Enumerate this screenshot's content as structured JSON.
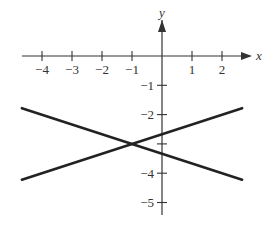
{
  "chart_data": {
    "type": "line",
    "title": "",
    "xlabel": "x",
    "ylabel": "y",
    "xlim": [
      -4.67,
      2.67
    ],
    "ylim": [
      -5.5,
      1.0
    ],
    "grid": false,
    "legend": null,
    "x_ticks": [
      -4,
      -3,
      -2,
      -1,
      1,
      2
    ],
    "x_tick_labels": [
      "−4",
      "−3",
      "−2",
      "−1",
      "1",
      "2"
    ],
    "y_ticks": [
      -1,
      -2,
      -3,
      -4,
      -5
    ],
    "y_tick_labels": [
      "−1",
      "−2",
      "",
      "−4",
      "−5"
    ],
    "series": [
      {
        "name": "line-decreasing",
        "equation": "y = -x/3 - 10/3",
        "x": [
          -4.67,
          2.67
        ],
        "y": [
          -1.78,
          -4.22
        ]
      },
      {
        "name": "line-increasing",
        "equation": "y = x/3 - 8/3",
        "x": [
          -4.67,
          2.67
        ],
        "y": [
          -4.22,
          -1.78
        ]
      }
    ],
    "annotations": [
      {
        "text": "intersection",
        "x": -1,
        "y": -3
      }
    ]
  },
  "colors": {
    "axis": "#333333",
    "line": "#222222"
  }
}
